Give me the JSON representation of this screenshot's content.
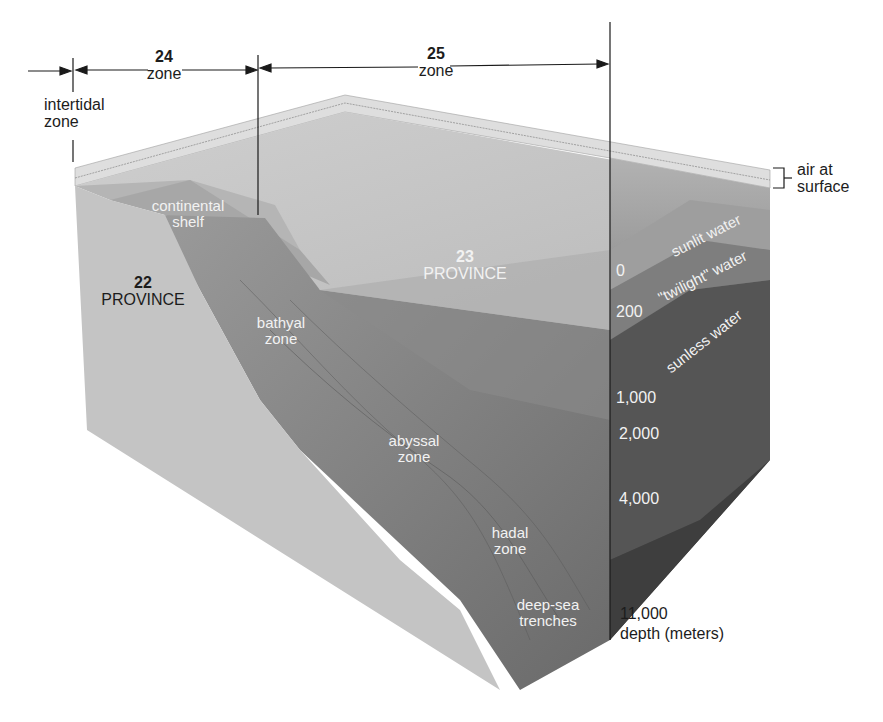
{
  "header": {
    "partial_caption": "(…) sp…"
  },
  "dimensions": {
    "intertidal": {
      "label_line1": "intertidal",
      "label_line2": "zone"
    },
    "zone_24": {
      "number": "24",
      "label": "zone"
    },
    "zone_25": {
      "number": "25",
      "label": "zone"
    }
  },
  "provinces": {
    "p22": {
      "number": "22",
      "label": "PROVINCE"
    },
    "p23": {
      "number": "23",
      "label": "PROVINCE"
    }
  },
  "seafloor_labels": {
    "continental_shelf": {
      "line1": "continental",
      "line2": "shelf"
    },
    "bathyal": {
      "line1": "bathyal",
      "line2": "zone"
    },
    "abyssal": {
      "line1": "abyssal",
      "line2": "zone"
    },
    "hadal": {
      "line1": "hadal",
      "line2": "zone"
    },
    "trenches": {
      "line1": "deep-sea",
      "line2": "trenches"
    }
  },
  "water_layers": {
    "air": {
      "line1": "air at",
      "line2": "surface"
    },
    "sunlit": "sunlit water",
    "twilight": "\"twilight\" water",
    "sunless": "sunless water"
  },
  "depth_scale": {
    "ticks": [
      "0",
      "200",
      "1,000",
      "2,000",
      "4,000",
      "11,000"
    ],
    "unit_label": "depth (meters)"
  },
  "colors": {
    "air_layer": "#dcdcdc",
    "surface_top": "#c8c8c8",
    "continental_face": "#c4c4c4",
    "sunlit": "#a8a8a8",
    "twilight": "#8a8a8a",
    "sunless": "#6c6c6c",
    "deep": "#4a4a4a",
    "line": "#1a1a1a"
  }
}
